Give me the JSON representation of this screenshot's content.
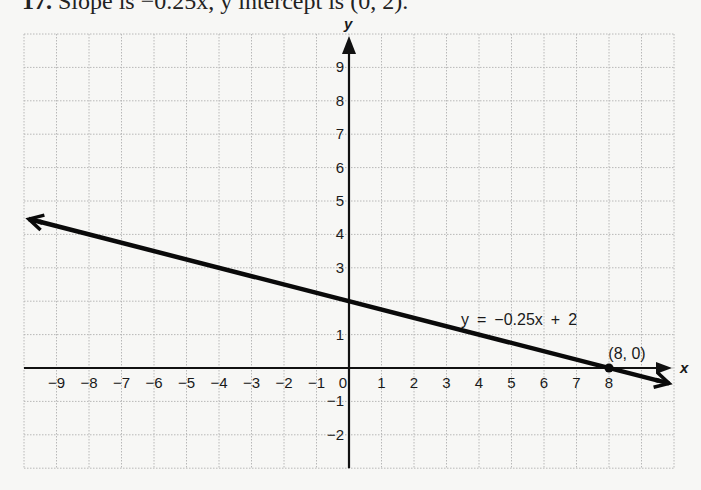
{
  "caption": {
    "number": "17.",
    "text": "Slope is −0.25x, y intercept is (0, 2)."
  },
  "chart_data": {
    "type": "line",
    "xlabel": "x",
    "ylabel": "y",
    "xlim": [
      -10,
      10
    ],
    "ylim": [
      -3,
      10
    ],
    "grid": true,
    "x_ticks": [
      "-9",
      "-8",
      "-7",
      "-6",
      "-5",
      "-4",
      "-3",
      "-2",
      "-1",
      "0",
      "1",
      "2",
      "3",
      "4",
      "5",
      "6",
      "7",
      "8"
    ],
    "y_ticks": [
      "9",
      "8",
      "7",
      "6",
      "5",
      "4",
      "3",
      "1",
      "-1",
      "-2"
    ],
    "series": [
      {
        "name": "y = -0.25x + 2",
        "equation": "y = −0.25x + 2",
        "slope": -0.25,
        "intercept": 2,
        "x": [
          -9.85,
          9.85
        ],
        "y": [
          4.46,
          -0.46
        ]
      }
    ],
    "annotations": [
      {
        "label": "(8, 0)",
        "x": 8,
        "y": 0,
        "type": "point"
      },
      {
        "label": "y = −0.25x + 2",
        "x": 4.7,
        "y": 1.5,
        "type": "equation"
      }
    ]
  }
}
